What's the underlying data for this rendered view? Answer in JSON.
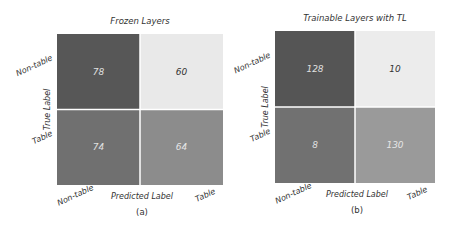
{
  "chart_data": [
    {
      "type": "heatmap",
      "title": "Frozen Layers",
      "caption": "(a)",
      "xlabel": "Predicted Label",
      "ylabel": "True Label",
      "x_categories": [
        "Non-table",
        "Table"
      ],
      "y_categories": [
        "Non-table",
        "Table"
      ],
      "values": [
        [
          78,
          60
        ],
        [
          74,
          64
        ]
      ],
      "cell_colors": [
        [
          "#575757",
          "#e9e9e9"
        ],
        [
          "#707070",
          "#8c8c8c"
        ]
      ],
      "text_colors": [
        [
          "#e0e0e0",
          "#333333"
        ],
        [
          "#e0e0e0",
          "#e6e6e6"
        ]
      ],
      "grid": false
    },
    {
      "type": "heatmap",
      "title": "Trainable Layers with TL",
      "caption": "(b)",
      "xlabel": "Predicted Label",
      "ylabel": "True Label",
      "x_categories": [
        "Non-table",
        "Table"
      ],
      "y_categories": [
        "Non-table",
        "Table"
      ],
      "values": [
        [
          128,
          10
        ],
        [
          8,
          130
        ]
      ],
      "cell_colors": [
        [
          "#555555",
          "#ececec"
        ],
        [
          "#717171",
          "#9a9a9a"
        ]
      ],
      "text_colors": [
        [
          "#e0e0e0",
          "#333333"
        ],
        [
          "#e0e0e0",
          "#e6e6e6"
        ]
      ],
      "grid": false
    }
  ]
}
